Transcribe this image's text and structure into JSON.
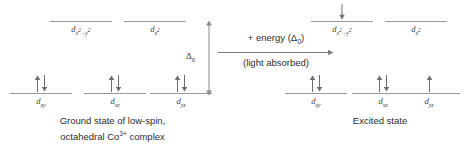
{
  "diagram": {
    "colors": {
      "line": "#9a9a9a",
      "arrow": "#6f6f6f",
      "text": "#2e2e2e",
      "label": "#3f3f3f",
      "background": "#ffffff"
    }
  },
  "ground_state": {
    "caption_line1": "Ground state of low-spin,",
    "caption_line2_pre": "octahedral Co",
    "caption_line2_sup": "3+",
    "caption_line2_post": " complex",
    "eg": [
      {
        "name": "dx2-y2",
        "label_d": "d",
        "sub_pre": "x",
        "sup_pre": "2",
        "sub_mid": "−y",
        "sup_post": "2",
        "electrons": []
      },
      {
        "name": "dz2",
        "label_d": "d",
        "sub_pre": "z",
        "sup_pre": "2",
        "sub_mid": "",
        "sup_post": "",
        "electrons": []
      }
    ],
    "t2g": [
      {
        "name": "dxy",
        "label_d": "d",
        "sub": "xy",
        "electrons": [
          "up",
          "down"
        ]
      },
      {
        "name": "dxz",
        "label_d": "d",
        "sub": "xz",
        "electrons": [
          "up",
          "down"
        ]
      },
      {
        "name": "dyz",
        "label_d": "d",
        "sub": "yz",
        "electrons": [
          "up",
          "down"
        ]
      }
    ]
  },
  "excited_state": {
    "caption_line1": "Excited state",
    "promotion_arrow": "down",
    "eg": [
      {
        "name": "dx2-y2",
        "label_d": "d",
        "sub_pre": "x",
        "sup_pre": "2",
        "sub_mid": "−y",
        "sup_post": "2",
        "electrons": [
          "down"
        ]
      },
      {
        "name": "dz2",
        "label_d": "d",
        "sub_pre": "z",
        "sup_pre": "2",
        "sub_mid": "",
        "sup_post": "",
        "electrons": []
      }
    ],
    "t2g": [
      {
        "name": "dxy",
        "label_d": "d",
        "sub": "xy",
        "electrons": [
          "up",
          "down"
        ]
      },
      {
        "name": "dxz",
        "label_d": "d",
        "sub": "xz",
        "electrons": [
          "up",
          "down"
        ]
      },
      {
        "name": "dyz",
        "label_d": "d",
        "sub": "yz",
        "electrons": [
          "up"
        ]
      }
    ]
  },
  "splitting": {
    "symbol": "Δ",
    "subscript": "0"
  },
  "reaction": {
    "top_pre": "+ energy (Δ",
    "top_sub": "0",
    "top_post": ")",
    "bottom": "(light absorbed)"
  }
}
